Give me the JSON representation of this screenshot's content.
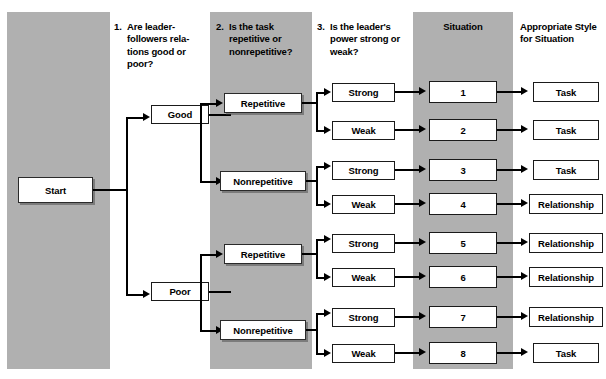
{
  "diagram": {
    "colors": {
      "band": "#b0b0b0",
      "box_fill": "#ffffff",
      "line": "#000000",
      "text": "#000000"
    },
    "columns": [
      {
        "id": "relations",
        "number": "1.",
        "heading": "Are leader-followers rela- tions good or poor?",
        "banded": true
      },
      {
        "id": "task",
        "number": "2.",
        "heading": "Is the task repetitive or nonrepetitive?",
        "banded": true
      },
      {
        "id": "power",
        "number": "3.",
        "heading": "Is the leader's power strong or weak?",
        "banded": false
      },
      {
        "id": "situation",
        "number": "",
        "heading": "Situation",
        "banded": true
      },
      {
        "id": "style",
        "number": "",
        "heading": "Appropriate Style for Situation",
        "banded": false
      }
    ],
    "start_node": {
      "label": "Start"
    },
    "relations_nodes": [
      {
        "label": "Good"
      },
      {
        "label": "Poor"
      }
    ],
    "task_nodes": [
      {
        "label": "Repetitive"
      },
      {
        "label": "Nonrepetitive"
      },
      {
        "label": "Repetitive"
      },
      {
        "label": "Nonrepetitive"
      }
    ],
    "power_nodes": [
      {
        "label": "Strong"
      },
      {
        "label": "Weak"
      },
      {
        "label": "Strong"
      },
      {
        "label": "Weak"
      },
      {
        "label": "Strong"
      },
      {
        "label": "Weak"
      },
      {
        "label": "Strong"
      },
      {
        "label": "Weak"
      }
    ],
    "situation_nodes": [
      {
        "label": "1"
      },
      {
        "label": "2"
      },
      {
        "label": "3"
      },
      {
        "label": "4"
      },
      {
        "label": "5"
      },
      {
        "label": "6"
      },
      {
        "label": "7"
      },
      {
        "label": "8"
      }
    ],
    "style_nodes": [
      {
        "label": "Task"
      },
      {
        "label": "Task"
      },
      {
        "label": "Task"
      },
      {
        "label": "Relationship"
      },
      {
        "label": "Relationship"
      },
      {
        "label": "Relationship"
      },
      {
        "label": "Relationship"
      },
      {
        "label": "Task"
      }
    ],
    "paths": [
      {
        "situation": "1",
        "relations": "Good",
        "task": "Repetitive",
        "power": "Strong",
        "style": "Task"
      },
      {
        "situation": "2",
        "relations": "Good",
        "task": "Repetitive",
        "power": "Weak",
        "style": "Task"
      },
      {
        "situation": "3",
        "relations": "Good",
        "task": "Nonrepetitive",
        "power": "Strong",
        "style": "Task"
      },
      {
        "situation": "4",
        "relations": "Good",
        "task": "Nonrepetitive",
        "power": "Weak",
        "style": "Relationship"
      },
      {
        "situation": "5",
        "relations": "Poor",
        "task": "Repetitive",
        "power": "Strong",
        "style": "Relationship"
      },
      {
        "situation": "6",
        "relations": "Poor",
        "task": "Repetitive",
        "power": "Weak",
        "style": "Relationship"
      },
      {
        "situation": "7",
        "relations": "Poor",
        "task": "Nonrepetitive",
        "power": "Strong",
        "style": "Relationship"
      },
      {
        "situation": "8",
        "relations": "Poor",
        "task": "Nonrepetitive",
        "power": "Weak",
        "style": "Task"
      }
    ]
  }
}
